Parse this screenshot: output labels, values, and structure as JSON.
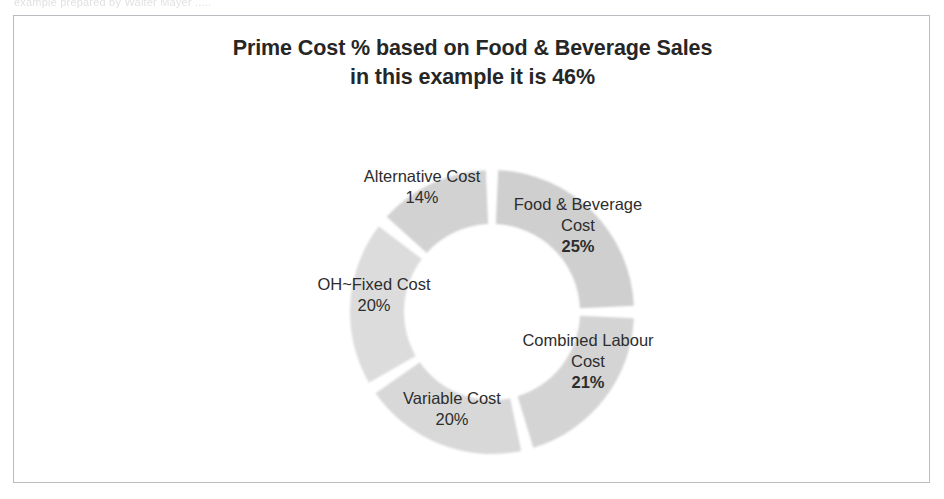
{
  "scan": {
    "top_text": "example prepared by Walter Mayer ....."
  },
  "chart": {
    "title_line1": "Prime Cost % based on Food & Beverage Sales",
    "title_line2": "in this example it is 46%"
  },
  "labels": {
    "alternative": {
      "name": "Alternative Cost",
      "pct": "14%"
    },
    "foodbev": {
      "name_line1": "Food & Beverage",
      "name_line2": "Cost",
      "pct": "25%"
    },
    "combined": {
      "name_line1": "Combined Labour",
      "name_line2": "Cost",
      "pct": "21%"
    },
    "variable": {
      "name": "Variable Cost",
      "pct": "20%"
    },
    "ohfixed": {
      "name": "OH~Fixed Cost",
      "pct": "20%"
    }
  },
  "colors": {
    "ring_light": "#dcdcdc",
    "ring_mid": "#cfcfcf",
    "ring_dark": "#b6b6b6",
    "frame": "#b9bcc0",
    "text": "#2d2d2d"
  },
  "chart_data": {
    "type": "pie",
    "variant": "doughnut",
    "title": "Prime Cost % based on Food & Beverage Sales in this example it is 46%",
    "categories": [
      "Food & Beverage Cost",
      "Combined Labour Cost",
      "Variable Cost",
      "OH~Fixed Cost",
      "Alternative Cost"
    ],
    "values": [
      25,
      21,
      20,
      20,
      14
    ],
    "unit": "%",
    "total": 100,
    "labels": [
      "25%",
      "21%",
      "20%",
      "20%",
      "14%"
    ],
    "legend": "none",
    "grid": false,
    "annotations": [
      "Prime Cost = Food & Beverage Cost + Combined Labour Cost = 46%"
    ],
    "slice_colors": [
      "#cfcfcf",
      "#d4d4d4",
      "#d8d8d8",
      "#dcdcdc",
      "#d2d2d2"
    ],
    "start_angle_deg": 0,
    "direction": "clockwise",
    "inner_radius_ratio": 0.62
  }
}
